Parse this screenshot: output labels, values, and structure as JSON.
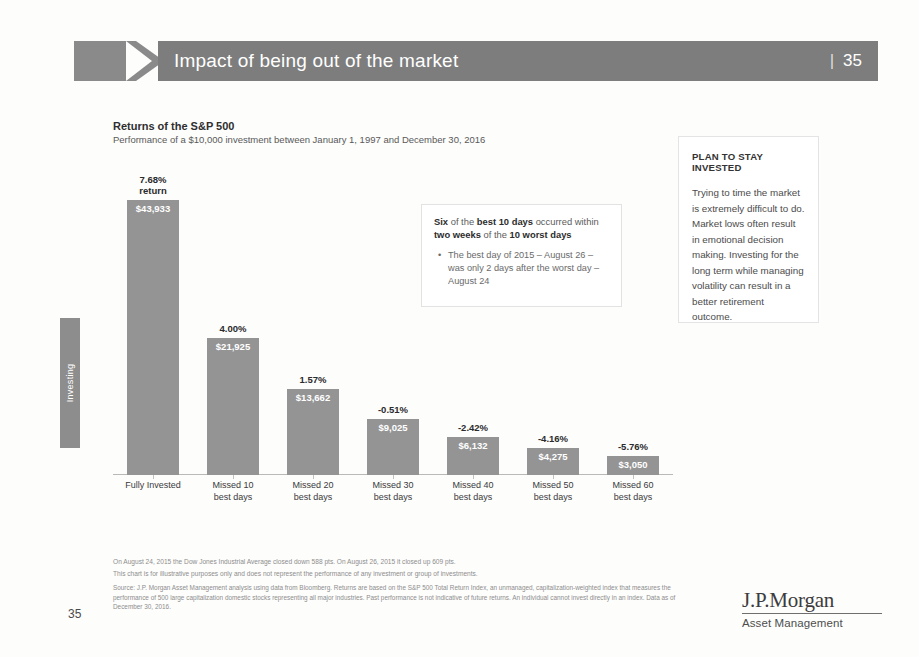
{
  "header": {
    "title": "Impact of being out of the market",
    "page_label": "35",
    "divider": "|"
  },
  "side_tab": {
    "label": "Investing"
  },
  "chart_header": {
    "title": "Returns of the S&P 500",
    "subtitle": "Performance of a $10,000 investment between January 1, 1997 and December 30, 2016"
  },
  "callout": {
    "head_1": "Six",
    "head_2": " of the ",
    "head_3": "best 10 days",
    "head_4": " occurred within ",
    "head_5": "two weeks",
    "head_6": " of the ",
    "head_7": "10 worst days",
    "bullet_glyph": "•",
    "bullet_1": "The best day of 2015 – August 26 – was only 2 days after the worst day – August 24"
  },
  "panel": {
    "title": "PLAN TO STAY INVESTED",
    "body": "Trying to time the market is extremely difficult to do. Market lows often result in emotional decision making. Investing for the long term while managing volatility can result in a better retirement outcome."
  },
  "footnotes": {
    "line1": "On August 24, 2015 the Dow Jones Industrial Average closed down 588 pts. On August 26, 2015 it closed up 609 pts.",
    "line2": "This chart is for illustrative purposes only and does not represent the performance of any investment or group of investments.",
    "source": "Source: J.P. Morgan Asset Management analysis using data from Bloomberg. Returns are based on the S&P 500 Total Return Index, an unmanaged, capitalization-weighted index that measures the performance of 500 large capitalization domestic stocks representing all major industries. Past performance is not indicative of future returns. An individual cannot invest directly in an index. Data as of December 30, 2016."
  },
  "page_number": "35",
  "logo": {
    "main": "J.P.Morgan",
    "sub": "Asset Management"
  },
  "colors": {
    "bar": "#949494",
    "header_bar": "#7d7d7d",
    "side_tab": "#8d8d8d"
  },
  "chart_data": {
    "type": "bar",
    "title": "Returns of the S&P 500",
    "subtitle": "Performance of a $10,000 investment between January 1, 1997 and December 30, 2016",
    "xlabel": "",
    "ylabel": "",
    "grid": false,
    "legend": "none",
    "ylim": [
      0,
      43933
    ],
    "categories": [
      "Fully Invested",
      "Missed 10\nbest days",
      "Missed 20\nbest days",
      "Missed 30\nbest days",
      "Missed 40\nbest days",
      "Missed 50\nbest days",
      "Missed 60\nbest days"
    ],
    "values": [
      43933,
      21925,
      13662,
      9025,
      6132,
      4275,
      3050
    ],
    "value_labels": [
      "$43,933",
      "$21,925",
      "$13,662",
      "$9,025",
      "$6,132",
      "$4,275",
      "$3,050"
    ],
    "top_labels": [
      "7.68%\nreturn",
      "4.00%",
      "1.57%",
      "-0.51%",
      "-2.42%",
      "-4.16%",
      "-5.76%"
    ],
    "annualized_returns_pct": [
      7.68,
      4.0,
      1.57,
      -0.51,
      -2.42,
      -4.16,
      -5.76
    ]
  }
}
